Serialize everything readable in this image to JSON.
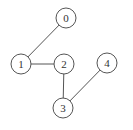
{
  "graph": {
    "nodes": [
      {
        "id": "0",
        "label": "0",
        "x": 66,
        "y": 18
      },
      {
        "id": "1",
        "label": "1",
        "x": 21,
        "y": 64
      },
      {
        "id": "2",
        "label": "2",
        "x": 64,
        "y": 64
      },
      {
        "id": "3",
        "label": "3",
        "x": 63,
        "y": 108
      },
      {
        "id": "4",
        "label": "4",
        "x": 107,
        "y": 63
      }
    ],
    "edges": [
      {
        "from": "0",
        "to": "1"
      },
      {
        "from": "1",
        "to": "2"
      },
      {
        "from": "2",
        "to": "3"
      },
      {
        "from": "3",
        "to": "4"
      }
    ],
    "node_radius": 10,
    "colors": {
      "stroke": "#555555",
      "fill": "#ffffff",
      "text": "#333333"
    }
  }
}
